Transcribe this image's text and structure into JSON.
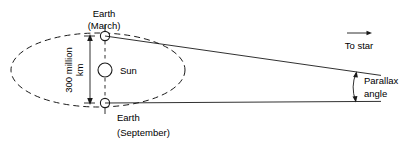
{
  "diagram": {
    "background_color": "#ffffff",
    "line_color": "#1a1a1a"
  },
  "labels": {
    "earth_march_line1": "Earth",
    "earth_march_line2": "(March)",
    "earth_september_line1": "Earth",
    "earth_september_line2": "(September)",
    "sun": "Sun",
    "baseline_line1": "300 million",
    "baseline_line2": "km",
    "to_star": "To star",
    "parallax_line1": "Parallax",
    "parallax_line2": "angle"
  },
  "icons": {
    "to_star_arrow": "arrow-right-icon",
    "baseline_dimension": "double-arrow-vertical-icon",
    "parallax_arc": "double-arrow-arc-icon",
    "sun_body": "sun-circle-icon",
    "earth_body_march": "earth-circle-icon",
    "earth_body_september": "earth-circle-icon",
    "orbit_path": "dashed-ellipse-icon"
  },
  "geometry": {
    "orbit_center_x": 98,
    "orbit_center_y": 70,
    "orbit_rx": 87,
    "orbit_ry": 37,
    "earth_march_x": 105,
    "earth_march_y": 36,
    "earth_september_x": 105,
    "earth_september_y": 103,
    "sun_x": 105,
    "sun_y": 70,
    "sun_r": 7,
    "earth_r": 4.6,
    "convergence_x": 357,
    "baseline_value": "300 million km"
  }
}
